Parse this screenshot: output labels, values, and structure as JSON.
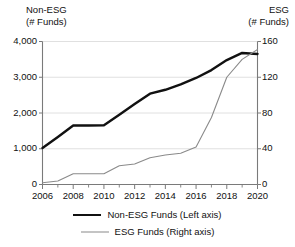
{
  "chart_data": {
    "type": "line",
    "title": "",
    "xlabel": "",
    "x": [
      2006,
      2007,
      2008,
      2009,
      2010,
      2011,
      2012,
      2013,
      2014,
      2015,
      2016,
      2017,
      2018,
      2019,
      2020
    ],
    "grid": true,
    "legend_position": "bottom",
    "left_axis": {
      "title_line1": "Non-ESG",
      "title_line2": "(# Funds)",
      "ylabel": "Non-ESG (# Funds)",
      "ylim": [
        0,
        4000
      ],
      "ticks": [
        0,
        1000,
        2000,
        3000,
        4000
      ],
      "tick_labels": [
        "0",
        "1,000",
        "2,000",
        "3,000",
        "4,000"
      ]
    },
    "right_axis": {
      "title_line1": "ESG",
      "title_line2": "(# Funds)",
      "ylabel": "ESG (# Funds)",
      "ylim": [
        0,
        160
      ],
      "ticks": [
        0,
        40,
        80,
        120,
        160
      ],
      "tick_labels": [
        "0",
        "40",
        "80",
        "120",
        "160"
      ]
    },
    "xtick_labels": [
      "2006",
      "2008",
      "2010",
      "2012",
      "2014",
      "2016",
      "2018",
      "2020"
    ],
    "xticks": [
      2006,
      2008,
      2010,
      2012,
      2014,
      2016,
      2018,
      2020
    ],
    "xlim": [
      2006,
      2020
    ],
    "minor_xticks": [
      2007,
      2009,
      2011,
      2013,
      2015,
      2017,
      2019
    ],
    "series": [
      {
        "name": "Non-ESG Funds (Left axis)",
        "axis": "left",
        "color": "#111111",
        "width": 2.4,
        "values": [
          1020,
          1330,
          1650,
          1650,
          1655,
          1950,
          2250,
          2540,
          2650,
          2800,
          2980,
          3200,
          3480,
          3680,
          3650
        ]
      },
      {
        "name": "ESG Funds (Right axis)",
        "axis": "right",
        "color": "#8a8a8a",
        "width": 1.1,
        "values": [
          2,
          4,
          12,
          12,
          12,
          21,
          23,
          30,
          33,
          35,
          42,
          75,
          120,
          140,
          151
        ]
      }
    ]
  },
  "legend": {
    "items": [
      {
        "label": "Non-ESG Funds (Left axis)",
        "style": "thick"
      },
      {
        "label": "ESG Funds (Right axis)",
        "style": "thin"
      }
    ]
  },
  "colors": {
    "non_esg_line": "#111111",
    "esg_line": "#8a8a8a",
    "gridline": "#dcdcdc",
    "axis": "#7a7a7a",
    "text": "#111111",
    "background": "#ffffff"
  }
}
